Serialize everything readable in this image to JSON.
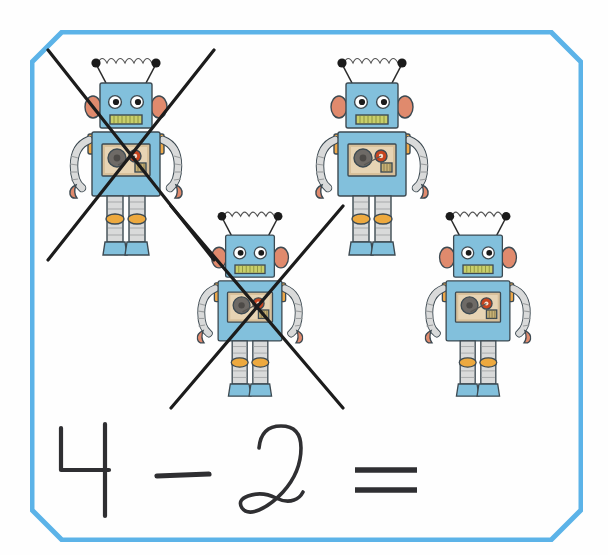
{
  "worksheet": {
    "title": "Subtraction picture worksheet",
    "background_color": "#fefefe",
    "border_color": "#5cb3e8",
    "border_shape": "octagon",
    "border_width_px": 5
  },
  "equation": {
    "minuend": "4",
    "operator": "–",
    "subtrahend": "2",
    "equals": "=",
    "answer": "",
    "full_text": "4 – 2 =",
    "ink_color": "#2f2f32",
    "style": "handwritten"
  },
  "counting": {
    "total_objects": 4,
    "crossed_out": 2,
    "remaining": 2,
    "object_name": "robot"
  },
  "robot_palette": {
    "body_blue": "#82c0dc",
    "body_blue_dark": "#6aaecd",
    "outline": "#3d4a52",
    "ear_orange": "#e08a6d",
    "shoulder_orange": "#efa94a",
    "panel_tan": "#d8c09a",
    "panel_tan_light": "#e7d4b4",
    "reel_gray": "#6e6a66",
    "knob_red": "#c8451f",
    "mouth_green": "#c9cf6a",
    "limb_gray": "#d9dada",
    "limb_gray_dark": "#b0b2b3",
    "knee_orange": "#eda93f",
    "antenna_black": "#1b1b1b",
    "spring_white": "#fbfbfb"
  },
  "robots": [
    {
      "id": "robot-1",
      "position": "top-left",
      "crossed_out": true,
      "x": 62,
      "y": 52,
      "scale": 1.0
    },
    {
      "id": "robot-2",
      "position": "top-right",
      "crossed_out": false,
      "x": 308,
      "y": 52,
      "scale": 1.0
    },
    {
      "id": "robot-3",
      "position": "middle-center",
      "crossed_out": true,
      "x": 190,
      "y": 206,
      "scale": 0.93
    },
    {
      "id": "robot-4",
      "position": "bottom-right",
      "crossed_out": false,
      "x": 418,
      "y": 206,
      "scale": 0.93
    }
  ],
  "crossouts": [
    {
      "id": "crossout-1",
      "for": "robot-1",
      "x": 42,
      "y": 42,
      "w": 172,
      "h": 218,
      "color": "#1c1c1c"
    },
    {
      "id": "crossout-2",
      "for": "robot-3",
      "x": 165,
      "y": 198,
      "w": 180,
      "h": 212,
      "color": "#1c1c1c"
    }
  ]
}
